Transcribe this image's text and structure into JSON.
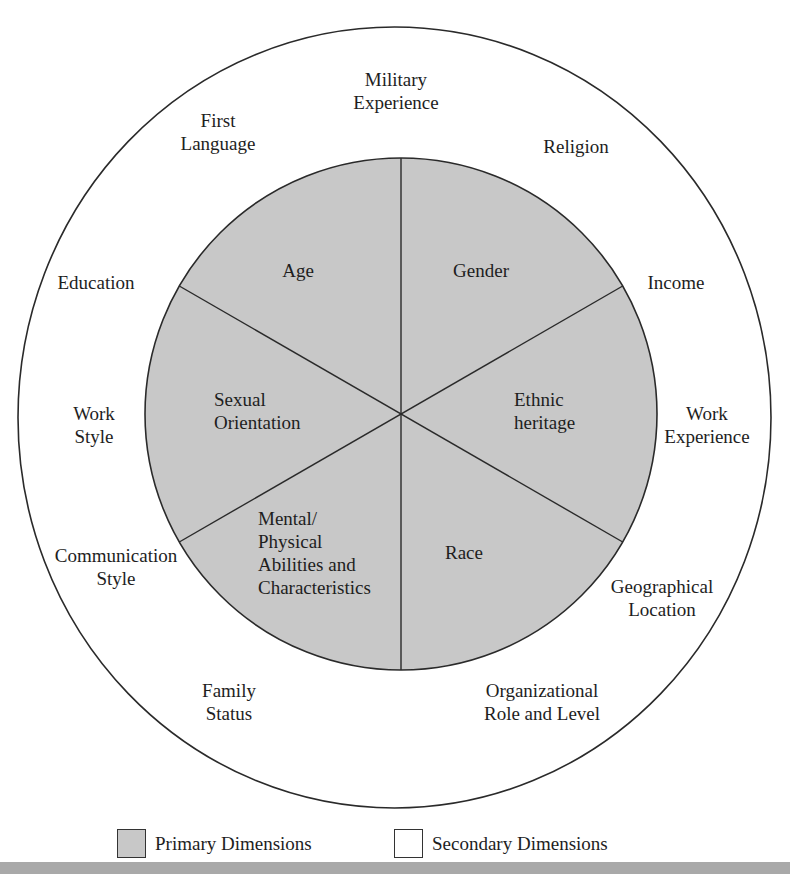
{
  "diagram": {
    "colors": {
      "primary_fill": "#c8c8c8",
      "secondary_fill": "#ffffff",
      "stroke": "#2a2a2a",
      "bottom_strip": "#a9a9a9"
    },
    "primary_dimensions": [
      {
        "label": "Age"
      },
      {
        "label": "Gender"
      },
      {
        "label": "Sexual\nOrientation"
      },
      {
        "label": "Ethnic\nheritage"
      },
      {
        "label": "Mental/\nPhysical\nAbilities and\nCharacteristics"
      },
      {
        "label": "Race"
      }
    ],
    "secondary_dimensions": [
      {
        "label": "Military\nExperience"
      },
      {
        "label": "First\nLanguage"
      },
      {
        "label": "Religion"
      },
      {
        "label": "Education"
      },
      {
        "label": "Income"
      },
      {
        "label": "Work\nStyle"
      },
      {
        "label": "Work\nExperience"
      },
      {
        "label": "Communication\nStyle"
      },
      {
        "label": "Geographical\nLocation"
      },
      {
        "label": "Family\nStatus"
      },
      {
        "label": "Organizational\nRole and Level"
      }
    ]
  },
  "legend": {
    "primary_label": "Primary Dimensions",
    "secondary_label": "Secondary Dimensions"
  }
}
